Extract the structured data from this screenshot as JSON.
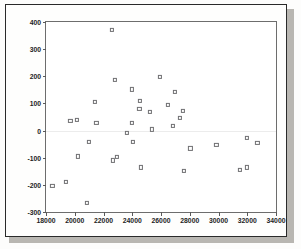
{
  "chart_data": {
    "type": "scatter",
    "title": "",
    "xlabel": "",
    "ylabel": "Unstandardized Residual",
    "xlim": [
      18000,
      34000
    ],
    "ylim": [
      -300,
      400
    ],
    "xticks": [
      18000,
      20000,
      22000,
      24000,
      26000,
      28000,
      30000,
      32000,
      34000
    ],
    "yticks": [
      -300,
      -200,
      -100,
      0,
      100,
      200,
      300,
      400
    ],
    "xtick_labels": [
      "18000",
      "20000",
      "22000",
      "24000",
      "26000",
      "28000",
      "30000",
      "32000",
      "34000"
    ],
    "ytick_labels": [
      "-300",
      "-200",
      "-100",
      "0",
      "100",
      "200",
      "300",
      "400"
    ],
    "grid": false,
    "legend": null,
    "marker": "open-square",
    "marker_color": "#6f6f72",
    "points": [
      {
        "x": 18450,
        "y": -205
      },
      {
        "x": 19400,
        "y": -190
      },
      {
        "x": 19700,
        "y": 35
      },
      {
        "x": 20150,
        "y": 40
      },
      {
        "x": 20200,
        "y": -95
      },
      {
        "x": 20850,
        "y": -265
      },
      {
        "x": 21000,
        "y": -42
      },
      {
        "x": 21400,
        "y": 106
      },
      {
        "x": 21500,
        "y": 27
      },
      {
        "x": 22600,
        "y": 370
      },
      {
        "x": 22650,
        "y": -110
      },
      {
        "x": 22800,
        "y": 186
      },
      {
        "x": 22950,
        "y": -96
      },
      {
        "x": 23600,
        "y": -8
      },
      {
        "x": 23950,
        "y": 28
      },
      {
        "x": 24000,
        "y": 152
      },
      {
        "x": 24050,
        "y": -42
      },
      {
        "x": 24500,
        "y": 80
      },
      {
        "x": 24550,
        "y": 108
      },
      {
        "x": 24600,
        "y": -136
      },
      {
        "x": 25250,
        "y": 68
      },
      {
        "x": 25350,
        "y": 4
      },
      {
        "x": 25900,
        "y": 198
      },
      {
        "x": 26500,
        "y": 94
      },
      {
        "x": 26800,
        "y": 17
      },
      {
        "x": 26950,
        "y": 142
      },
      {
        "x": 27300,
        "y": 46
      },
      {
        "x": 27550,
        "y": 72
      },
      {
        "x": 27600,
        "y": -148
      },
      {
        "x": 28050,
        "y": -66
      },
      {
        "x": 29850,
        "y": -52
      },
      {
        "x": 31500,
        "y": -144
      },
      {
        "x": 31950,
        "y": -136
      },
      {
        "x": 32000,
        "y": -27
      },
      {
        "x": 32700,
        "y": -45
      }
    ]
  },
  "figure": {
    "y_axis_title": "Unstandardized Residual"
  }
}
